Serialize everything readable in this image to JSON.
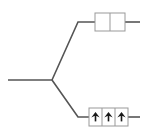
{
  "diagram": {
    "type": "branch-tree",
    "width": 147,
    "height": 133,
    "background_color": "#ffffff",
    "line_color": "#555555",
    "line_width": 1.6,
    "box_border_color": "#999999",
    "box_fill_color": "#ffffff",
    "box_border_width": 1,
    "glyph_color": "#1a1a1a",
    "trunk": {
      "label": "trunk-line",
      "start_x": 8,
      "start_y": 80,
      "end_x": 52,
      "end_y": 80
    },
    "fork": {
      "label": "fork-node",
      "x": 52,
      "y": 80
    },
    "branches": [
      {
        "name": "upper-branch",
        "diagonal_from_x": 52,
        "diagonal_from_y": 80,
        "diagonal_to_x": 78,
        "diagonal_to_y": 22,
        "horizontal_to_x": 95,
        "horizontal_y": 22
      },
      {
        "name": "lower-branch",
        "diagonal_from_x": 52,
        "diagonal_from_y": 80,
        "diagonal_to_x": 78,
        "diagonal_to_y": 117,
        "horizontal_to_x": 89,
        "horizontal_y": 117
      }
    ],
    "nodes": [
      {
        "name": "upper-node-box",
        "x": 95,
        "y": 13,
        "width": 30,
        "height": 18,
        "cells": 2,
        "cell_contents": [
          "",
          ""
        ],
        "tail": {
          "from_x": 125,
          "to_x": 140,
          "y": 22
        }
      },
      {
        "name": "lower-node-box",
        "x": 89,
        "y": 108,
        "width": 39,
        "height": 18,
        "cells": 3,
        "cell_contents": [
          "up-arrow",
          "up-arrow",
          "up-arrow"
        ],
        "tail": {
          "from_x": 128,
          "to_x": 140,
          "y": 117
        }
      }
    ],
    "icons": {
      "up_arrow": "up-arrow-icon"
    }
  }
}
